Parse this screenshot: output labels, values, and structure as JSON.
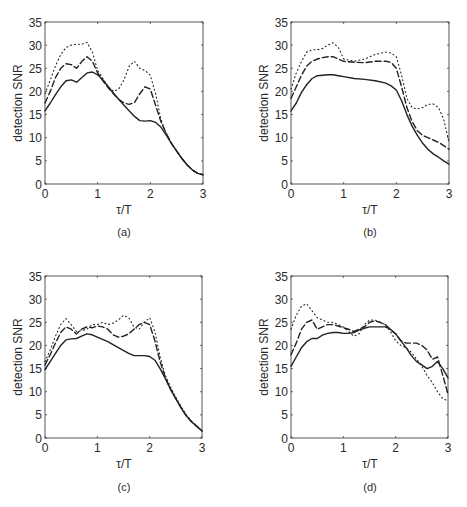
{
  "figure": {
    "ylabel": "detection SNR",
    "xlabel": "τ/T",
    "line_color": "#222222",
    "axis_color": "#444444"
  },
  "chart_data": [
    {
      "type": "line",
      "panel_label": "(a)",
      "title": "",
      "xlabel": "τ/T",
      "ylabel": "detection SNR",
      "xlim": [
        0,
        3
      ],
      "ylim": [
        0,
        35
      ],
      "xticks": [
        0,
        1,
        2,
        3
      ],
      "yticks": [
        0,
        5,
        10,
        15,
        20,
        25,
        30,
        35
      ],
      "grid": false,
      "legend": null,
      "series": [
        {
          "name": "solid",
          "style": "solid",
          "x": [
            0,
            0.1,
            0.2,
            0.3,
            0.4,
            0.5,
            0.6,
            0.7,
            0.8,
            0.9,
            1.0,
            1.1,
            1.2,
            1.3,
            1.4,
            1.5,
            1.6,
            1.7,
            1.8,
            1.9,
            2.0,
            2.1,
            2.2,
            2.3,
            2.4,
            2.5,
            2.6,
            2.7,
            2.8,
            2.9,
            3.0
          ],
          "y": [
            15.8,
            17.5,
            19.3,
            21.0,
            22.3,
            22.5,
            22.0,
            23.0,
            24.0,
            24.2,
            23.6,
            22.5,
            21.0,
            19.6,
            18.3,
            17.0,
            15.8,
            14.6,
            13.7,
            13.6,
            13.7,
            13.3,
            12.3,
            10.6,
            8.8,
            7.1,
            5.5,
            4.1,
            3.0,
            2.3,
            2.0
          ]
        },
        {
          "name": "dashed",
          "style": "dashed",
          "x": [
            0,
            0.1,
            0.2,
            0.3,
            0.4,
            0.5,
            0.6,
            0.7,
            0.8,
            0.9,
            1.0,
            1.1,
            1.2,
            1.3,
            1.4,
            1.5,
            1.6,
            1.7,
            1.8,
            1.9,
            2.0,
            2.1,
            2.2,
            2.3,
            2.4,
            2.5,
            2.6,
            2.7,
            2.8,
            2.9,
            3.0
          ],
          "y": [
            17.5,
            20.0,
            23.0,
            25.0,
            26.0,
            25.8,
            25.0,
            26.5,
            27.5,
            26.5,
            24.0,
            22.3,
            20.8,
            19.5,
            18.3,
            17.5,
            17.2,
            17.6,
            19.5,
            21.0,
            20.5,
            17.0,
            13.5,
            11.0,
            8.8,
            7.1,
            5.5,
            4.1,
            3.0,
            2.3,
            2.0
          ]
        },
        {
          "name": "dotted",
          "style": "dotted",
          "x": [
            0,
            0.1,
            0.2,
            0.3,
            0.4,
            0.5,
            0.6,
            0.7,
            0.8,
            0.9,
            1.0,
            1.1,
            1.2,
            1.3,
            1.4,
            1.5,
            1.6,
            1.7,
            1.8,
            1.9,
            2.0,
            2.1,
            2.2,
            2.3,
            2.4,
            2.5,
            2.6,
            2.7,
            2.8,
            2.9,
            3.0
          ],
          "y": [
            19.5,
            22.5,
            25.5,
            28.0,
            29.5,
            30.0,
            30.2,
            30.2,
            30.6,
            28.5,
            24.5,
            22.8,
            21.0,
            20.0,
            20.5,
            22.5,
            25.5,
            26.5,
            25.0,
            24.5,
            23.5,
            19.5,
            14.0,
            11.0,
            8.8,
            7.1,
            5.5,
            4.1,
            3.0,
            2.3,
            2.0
          ]
        }
      ]
    },
    {
      "type": "line",
      "panel_label": "(b)",
      "title": "",
      "xlabel": "τ/T",
      "ylabel": "detection SNR",
      "xlim": [
        0,
        3
      ],
      "ylim": [
        0,
        35
      ],
      "xticks": [
        0,
        1,
        2,
        3
      ],
      "yticks": [
        0,
        5,
        10,
        15,
        20,
        25,
        30,
        35
      ],
      "grid": false,
      "legend": null,
      "series": [
        {
          "name": "solid",
          "style": "solid",
          "x": [
            0,
            0.1,
            0.2,
            0.3,
            0.4,
            0.5,
            0.6,
            0.7,
            0.8,
            0.9,
            1.0,
            1.2,
            1.4,
            1.6,
            1.8,
            1.9,
            2.0,
            2.1,
            2.2,
            2.3,
            2.4,
            2.5,
            2.6,
            2.7,
            2.8,
            2.9,
            3.0
          ],
          "y": [
            15.8,
            17.5,
            19.8,
            21.5,
            22.8,
            23.4,
            23.5,
            23.6,
            23.6,
            23.4,
            23.2,
            22.8,
            22.6,
            22.3,
            21.8,
            21.2,
            20.3,
            18.0,
            15.0,
            12.5,
            10.5,
            8.8,
            7.5,
            6.5,
            5.8,
            5.0,
            4.3
          ]
        },
        {
          "name": "dashed",
          "style": "dashed",
          "x": [
            0,
            0.1,
            0.2,
            0.3,
            0.4,
            0.5,
            0.6,
            0.7,
            0.8,
            0.9,
            1.0,
            1.2,
            1.4,
            1.6,
            1.8,
            1.9,
            2.0,
            2.1,
            2.2,
            2.3,
            2.4,
            2.5,
            2.6,
            2.7,
            2.8,
            2.9,
            3.0
          ],
          "y": [
            18.5,
            21.0,
            23.5,
            25.5,
            26.5,
            27.0,
            27.3,
            27.5,
            27.5,
            27.0,
            26.5,
            26.3,
            26.2,
            26.5,
            26.5,
            26.3,
            25.0,
            21.0,
            16.5,
            13.5,
            11.5,
            10.5,
            10.0,
            9.5,
            9.0,
            8.3,
            7.5
          ]
        },
        {
          "name": "dotted",
          "style": "dotted",
          "x": [
            0,
            0.1,
            0.2,
            0.3,
            0.4,
            0.5,
            0.6,
            0.7,
            0.8,
            0.9,
            1.0,
            1.2,
            1.4,
            1.6,
            1.8,
            1.9,
            2.0,
            2.1,
            2.2,
            2.3,
            2.4,
            2.5,
            2.6,
            2.7,
            2.8,
            2.9,
            3.0
          ],
          "y": [
            20.5,
            24.0,
            26.5,
            28.5,
            29.0,
            29.0,
            29.3,
            30.0,
            30.5,
            29.5,
            27.0,
            26.5,
            27.0,
            28.0,
            28.5,
            28.3,
            27.5,
            23.5,
            18.5,
            16.5,
            16.2,
            16.5,
            17.2,
            17.3,
            16.5,
            14.0,
            9.0
          ]
        }
      ]
    },
    {
      "type": "line",
      "panel_label": "(c)",
      "title": "",
      "xlabel": "τ/T",
      "ylabel": "detection SNR",
      "xlim": [
        0,
        3
      ],
      "ylim": [
        0,
        35
      ],
      "xticks": [
        0,
        1,
        2,
        3
      ],
      "yticks": [
        0,
        5,
        10,
        15,
        20,
        25,
        30,
        35
      ],
      "grid": false,
      "legend": null,
      "series": [
        {
          "name": "solid",
          "style": "solid",
          "x": [
            0,
            0.1,
            0.2,
            0.3,
            0.4,
            0.5,
            0.6,
            0.7,
            0.8,
            0.9,
            1.0,
            1.2,
            1.4,
            1.6,
            1.7,
            1.8,
            1.9,
            2.0,
            2.1,
            2.2,
            2.3,
            2.4,
            2.5,
            2.6,
            2.7,
            2.8,
            2.9,
            3.0
          ],
          "y": [
            14.8,
            16.5,
            18.3,
            20.0,
            21.2,
            21.4,
            21.5,
            22.0,
            22.5,
            22.3,
            21.8,
            20.8,
            19.5,
            18.3,
            17.8,
            17.8,
            17.8,
            17.6,
            16.8,
            15.0,
            12.8,
            10.5,
            8.5,
            6.5,
            4.8,
            3.5,
            2.5,
            1.5
          ]
        },
        {
          "name": "dashed",
          "style": "dashed",
          "x": [
            0,
            0.1,
            0.2,
            0.3,
            0.4,
            0.5,
            0.6,
            0.7,
            0.8,
            0.9,
            1.0,
            1.1,
            1.2,
            1.3,
            1.4,
            1.5,
            1.6,
            1.7,
            1.8,
            1.9,
            2.0,
            2.1,
            2.2,
            2.3,
            2.4,
            2.5,
            2.6,
            2.7,
            2.8,
            2.9,
            3.0
          ],
          "y": [
            15.8,
            18.0,
            20.5,
            22.8,
            24.0,
            23.5,
            22.5,
            23.5,
            24.0,
            23.8,
            24.2,
            24.0,
            23.5,
            22.3,
            21.8,
            22.0,
            22.5,
            23.5,
            24.5,
            25.0,
            24.5,
            21.0,
            16.5,
            13.0,
            10.5,
            8.5,
            6.5,
            4.8,
            3.5,
            2.5,
            1.5
          ]
        },
        {
          "name": "dotted",
          "style": "dotted",
          "x": [
            0,
            0.1,
            0.2,
            0.3,
            0.4,
            0.5,
            0.6,
            0.7,
            0.8,
            0.9,
            1.0,
            1.1,
            1.2,
            1.3,
            1.4,
            1.5,
            1.6,
            1.7,
            1.8,
            1.9,
            2.0,
            2.1,
            2.2,
            2.3,
            2.4,
            2.5,
            2.6,
            2.7,
            2.8,
            2.9,
            3.0
          ],
          "y": [
            16.5,
            19.0,
            22.0,
            24.5,
            25.8,
            24.5,
            23.0,
            23.2,
            23.5,
            24.5,
            24.5,
            25.0,
            24.5,
            24.8,
            25.5,
            26.5,
            26.0,
            24.0,
            23.5,
            25.0,
            26.0,
            23.0,
            17.5,
            13.5,
            11.0,
            8.8,
            6.8,
            5.0,
            3.7,
            2.6,
            1.6
          ]
        }
      ]
    },
    {
      "type": "line",
      "panel_label": "(d)",
      "title": "",
      "xlabel": "τ/T",
      "ylabel": "detection SNR",
      "xlim": [
        0,
        3
      ],
      "ylim": [
        0,
        35
      ],
      "xticks": [
        0,
        1,
        2,
        3
      ],
      "yticks": [
        0,
        5,
        10,
        15,
        20,
        25,
        30,
        35
      ],
      "grid": false,
      "legend": null,
      "series": [
        {
          "name": "solid",
          "style": "solid",
          "x": [
            0,
            0.1,
            0.2,
            0.3,
            0.4,
            0.5,
            0.6,
            0.7,
            0.8,
            0.9,
            1.0,
            1.1,
            1.2,
            1.3,
            1.4,
            1.5,
            1.6,
            1.7,
            1.8,
            1.9,
            2.0,
            2.1,
            2.2,
            2.3,
            2.4,
            2.5,
            2.6,
            2.7,
            2.8,
            2.9,
            3.0
          ],
          "y": [
            15.5,
            17.5,
            19.5,
            20.8,
            21.5,
            21.5,
            22.2,
            22.6,
            22.8,
            22.8,
            22.6,
            22.6,
            22.8,
            23.3,
            23.7,
            24.0,
            24.0,
            24.0,
            24.0,
            23.5,
            22.5,
            21.0,
            19.5,
            17.8,
            16.5,
            15.8,
            15.0,
            15.5,
            16.5,
            15.0,
            13.0
          ]
        },
        {
          "name": "dashed",
          "style": "dashed",
          "x": [
            0,
            0.1,
            0.2,
            0.3,
            0.4,
            0.5,
            0.6,
            0.7,
            0.8,
            0.9,
            1.0,
            1.1,
            1.2,
            1.3,
            1.4,
            1.5,
            1.6,
            1.7,
            1.8,
            1.9,
            2.0,
            2.1,
            2.2,
            2.3,
            2.4,
            2.5,
            2.6,
            2.7,
            2.8,
            2.9,
            3.0
          ],
          "y": [
            18.0,
            20.5,
            23.5,
            25.0,
            25.5,
            23.5,
            24.0,
            24.5,
            24.5,
            24.2,
            23.8,
            23.5,
            23.0,
            23.5,
            24.0,
            25.0,
            25.3,
            25.0,
            24.5,
            23.5,
            22.5,
            21.0,
            20.5,
            20.5,
            20.5,
            20.0,
            19.0,
            17.0,
            17.5,
            13.5,
            9.5
          ]
        },
        {
          "name": "dotted",
          "style": "dotted",
          "x": [
            0,
            0.1,
            0.2,
            0.3,
            0.4,
            0.5,
            0.6,
            0.7,
            0.8,
            0.9,
            1.0,
            1.1,
            1.2,
            1.3,
            1.4,
            1.5,
            1.6,
            1.7,
            1.8,
            1.9,
            2.0,
            2.1,
            2.2,
            2.3,
            2.4,
            2.5,
            2.6,
            2.7,
            2.8,
            2.9,
            3.0
          ],
          "y": [
            23.5,
            26.5,
            28.5,
            29.0,
            27.5,
            26.0,
            25.5,
            25.0,
            25.0,
            24.5,
            24.0,
            23.0,
            22.0,
            22.5,
            24.5,
            25.5,
            25.5,
            25.0,
            24.5,
            23.0,
            21.0,
            20.0,
            19.5,
            18.5,
            17.0,
            15.5,
            13.5,
            12.0,
            10.0,
            8.5,
            8.0
          ]
        }
      ]
    }
  ]
}
